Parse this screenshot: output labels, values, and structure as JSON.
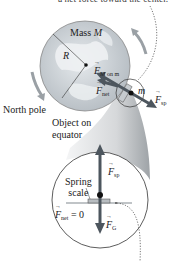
{
  "caption_top": "a net force toward the center.",
  "earth": {
    "mass_label": "Mass",
    "mass_symbol": "M",
    "radius_symbol": "R",
    "north_pole_label": "North pole"
  },
  "object": {
    "label_line1": "Object on",
    "label_line2": "equator",
    "mass_symbol": "m"
  },
  "forces": {
    "gravity_top": {
      "symbol": "F",
      "subscript": "M on m"
    },
    "net_top": {
      "symbol": "F",
      "subscript": "net"
    },
    "spring_top": {
      "symbol": "F",
      "subscript": "sp"
    },
    "spring_inset": {
      "symbol": "F",
      "subscript": "sp"
    },
    "gravity_inset": {
      "symbol": "F",
      "subscript": "G"
    },
    "net_inset": {
      "symbol": "F",
      "subscript": "net",
      "equals": "= 0"
    }
  },
  "inset": {
    "scale_label_line1": "Spring",
    "scale_label_line2": "scale"
  },
  "colors": {
    "earth_fill": "#c9cfd4",
    "earth_land": "#e8ecee",
    "arrow": "#505a63",
    "funnel": "#d8dadc",
    "outline": "#333333"
  }
}
